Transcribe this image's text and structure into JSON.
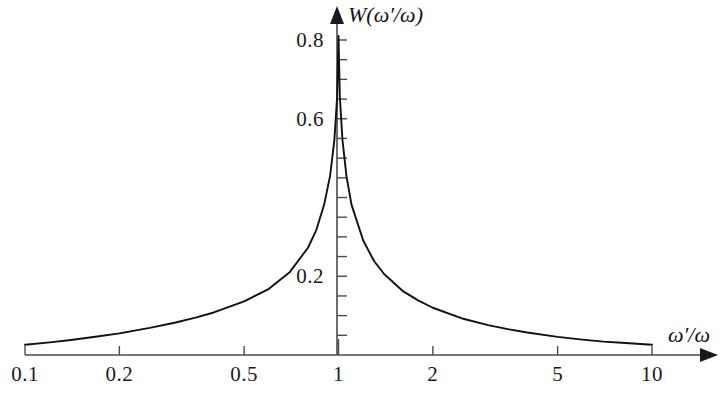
{
  "figure": {
    "background_color": "#ffffff",
    "curve_color": "#111111",
    "axis_color": "#4a4a4a"
  },
  "axes": {
    "y_title": "W(ω′/ω)",
    "x_title": "ω′/ω"
  },
  "chart_data": {
    "type": "line",
    "title": "",
    "subtitle": "",
    "xlabel": "ω′/ω",
    "ylabel": "W(ω′/ω)",
    "xscale": "log",
    "yscale": "linear",
    "xlim": [
      0.1,
      10
    ],
    "ylim": [
      0,
      0.85
    ],
    "grid": false,
    "legend": null,
    "xtick_labels": [
      "0.1",
      "0.2",
      "0.5",
      "1",
      "2",
      "5",
      "10"
    ],
    "xtick_values": [
      0.1,
      0.2,
      0.5,
      1,
      2,
      5,
      10
    ],
    "ytick_labels": [
      "0.2",
      "0.6",
      "0.8"
    ],
    "ytick_values": [
      0.2,
      0.6,
      0.8
    ],
    "y_minor_tick_step": 0.05,
    "annotations": [],
    "series": [
      {
        "name": "W(ω′/ω)",
        "x": [
          0.1,
          0.12,
          0.14,
          0.17,
          0.2,
          0.25,
          0.3,
          0.35,
          0.4,
          0.5,
          0.6,
          0.7,
          0.8,
          0.85,
          0.9,
          0.94,
          0.97,
          0.99,
          1.0,
          1.01,
          1.03,
          1.06,
          1.1,
          1.2,
          1.3,
          1.4,
          1.6,
          1.8,
          2.0,
          2.5,
          3.0,
          3.5,
          4.0,
          5.0,
          6.0,
          7.0,
          8.0,
          10.0
        ],
        "y": [
          0.026,
          0.032,
          0.038,
          0.047,
          0.055,
          0.069,
          0.082,
          0.095,
          0.108,
          0.136,
          0.168,
          0.211,
          0.273,
          0.318,
          0.382,
          0.455,
          0.545,
          0.655,
          0.81,
          0.655,
          0.545,
          0.455,
          0.382,
          0.29,
          0.238,
          0.205,
          0.163,
          0.138,
          0.12,
          0.092,
          0.076,
          0.065,
          0.057,
          0.046,
          0.039,
          0.034,
          0.031,
          0.026
        ]
      }
    ]
  }
}
